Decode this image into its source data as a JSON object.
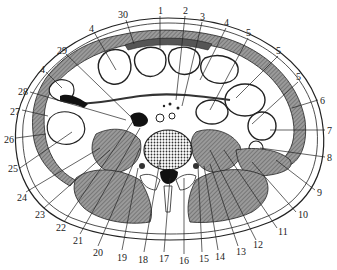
{
  "figure": {
    "type": "anatomical-cross-section",
    "colors": {
      "background": "#ffffff",
      "line": "#222222",
      "muscle_fill": "#8a8a8a",
      "dark_fill": "#111111",
      "organ_fill": "#ffffff"
    }
  },
  "labels": [
    {
      "id": "1",
      "text": "1",
      "x": 158,
      "y": 6
    },
    {
      "id": "2",
      "text": "2",
      "x": 183,
      "y": 6
    },
    {
      "id": "3",
      "text": "3",
      "x": 200,
      "y": 12
    },
    {
      "id": "4a",
      "text": "4",
      "x": 224,
      "y": 18
    },
    {
      "id": "5a",
      "text": "5",
      "x": 246,
      "y": 28
    },
    {
      "id": "5b",
      "text": "5",
      "x": 276,
      "y": 46
    },
    {
      "id": "5c",
      "text": "5",
      "x": 296,
      "y": 72
    },
    {
      "id": "6",
      "text": "6",
      "x": 320,
      "y": 96
    },
    {
      "id": "7",
      "text": "7",
      "x": 327,
      "y": 126
    },
    {
      "id": "8",
      "text": "8",
      "x": 327,
      "y": 153
    },
    {
      "id": "9",
      "text": "9",
      "x": 317,
      "y": 188
    },
    {
      "id": "10",
      "text": "10",
      "x": 298,
      "y": 210
    },
    {
      "id": "11",
      "text": "11",
      "x": 278,
      "y": 227
    },
    {
      "id": "12",
      "text": "12",
      "x": 253,
      "y": 240
    },
    {
      "id": "13",
      "text": "13",
      "x": 236,
      "y": 247
    },
    {
      "id": "14",
      "text": "14",
      "x": 215,
      "y": 252
    },
    {
      "id": "15",
      "text": "15",
      "x": 199,
      "y": 254
    },
    {
      "id": "16",
      "text": "16",
      "x": 179,
      "y": 256
    },
    {
      "id": "17",
      "text": "17",
      "x": 159,
      "y": 254
    },
    {
      "id": "18",
      "text": "18",
      "x": 138,
      "y": 255
    },
    {
      "id": "19",
      "text": "19",
      "x": 117,
      "y": 253
    },
    {
      "id": "20",
      "text": "20",
      "x": 93,
      "y": 248
    },
    {
      "id": "21",
      "text": "21",
      "x": 73,
      "y": 236
    },
    {
      "id": "22",
      "text": "22",
      "x": 56,
      "y": 223
    },
    {
      "id": "23",
      "text": "23",
      "x": 35,
      "y": 210
    },
    {
      "id": "24",
      "text": "24",
      "x": 17,
      "y": 193
    },
    {
      "id": "25",
      "text": "25",
      "x": 8,
      "y": 164
    },
    {
      "id": "26",
      "text": "26",
      "x": 4,
      "y": 135
    },
    {
      "id": "27",
      "text": "27",
      "x": 10,
      "y": 107
    },
    {
      "id": "28",
      "text": "28",
      "x": 18,
      "y": 87
    },
    {
      "id": "4b",
      "text": "4",
      "x": 40,
      "y": 65
    },
    {
      "id": "29",
      "text": "29",
      "x": 57,
      "y": 46
    },
    {
      "id": "4c",
      "text": "4",
      "x": 89,
      "y": 24
    },
    {
      "id": "30",
      "text": "30",
      "x": 118,
      "y": 10
    }
  ]
}
